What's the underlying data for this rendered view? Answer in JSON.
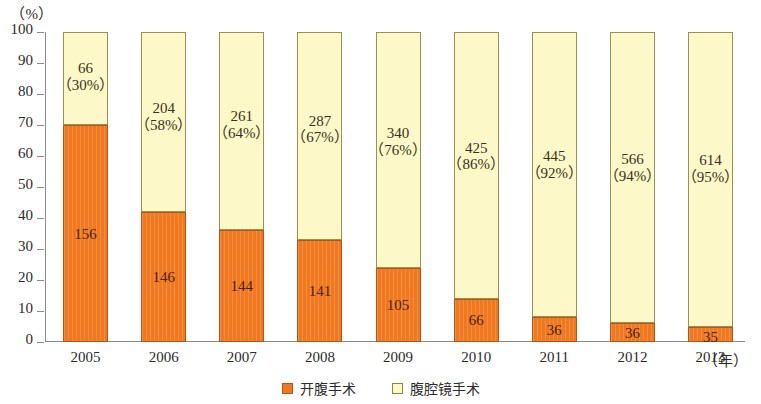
{
  "chart_data": {
    "type": "bar",
    "stacked": true,
    "stacked_mode": "percent",
    "title": "",
    "subtitle": "",
    "xlabel": "(年)",
    "ylabel": "(%)",
    "ylim": [
      0,
      100
    ],
    "yticks": [
      0,
      10,
      20,
      30,
      40,
      50,
      60,
      70,
      80,
      90,
      100
    ],
    "ytick_labels": [
      "0",
      "10",
      "20",
      "30",
      "40",
      "50",
      "60",
      "70",
      "80",
      "90",
      "100"
    ],
    "grid": false,
    "legend_position": "bottom-center",
    "categories": [
      "2005",
      "2006",
      "2007",
      "2008",
      "2009",
      "2010",
      "2011",
      "2012",
      "2013"
    ],
    "series": [
      {
        "name": "开腹手术",
        "color": "#f0781e",
        "values": [
          156,
          146,
          144,
          141,
          105,
          66,
          36,
          36,
          35
        ],
        "percents": [
          70,
          42,
          36,
          33,
          24,
          14,
          8,
          6,
          5
        ],
        "labels": [
          "156",
          "146",
          "144",
          "141",
          "105",
          "66",
          "36",
          "36",
          "35"
        ],
        "sublabels": [
          "",
          "",
          "",
          "",
          "",
          "",
          "",
          "",
          ""
        ]
      },
      {
        "name": "腹腔镜手术",
        "color": "#fcf8c8",
        "values": [
          66,
          204,
          261,
          287,
          340,
          425,
          445,
          566,
          614
        ],
        "percents": [
          30,
          58,
          64,
          67,
          76,
          86,
          92,
          94,
          95
        ],
        "labels": [
          "66",
          "204",
          "261",
          "287",
          "340",
          "425",
          "445",
          "566",
          "614"
        ],
        "sublabels": [
          "（30%）",
          "（58%）",
          "（64%）",
          "（67%）",
          "（76%）",
          "（86%）",
          "（92%）",
          "（94%）",
          "（95%）"
        ]
      }
    ]
  },
  "axis": {
    "unit_label": "（%）",
    "x_unit_label": "（年）"
  },
  "legend": {
    "items": [
      {
        "label": "开腹手术",
        "swatch": "orange-swatch-icon"
      },
      {
        "label": "腹腔镜手术",
        "swatch": "yellow-swatch-icon"
      }
    ]
  }
}
